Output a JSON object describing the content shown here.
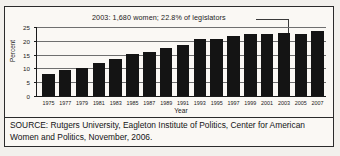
{
  "chart_data": {
    "type": "bar",
    "title": "",
    "xlabel": "Year",
    "ylabel": "Percent",
    "ylim": [
      0,
      25
    ],
    "yticks": [
      0,
      5,
      10,
      15,
      20,
      25
    ],
    "grid": true,
    "legend": null,
    "categories": [
      "1975",
      "1977",
      "1979",
      "1981",
      "1983",
      "1985",
      "1987",
      "1989",
      "1991",
      "1993",
      "1995",
      "1997",
      "1999",
      "2001",
      "2003",
      "2005",
      "2007"
    ],
    "values": [
      8.0,
      9.3,
      10.2,
      12.1,
      13.5,
      15.1,
      16.0,
      17.4,
      18.6,
      20.6,
      20.7,
      21.7,
      22.5,
      22.6,
      22.8,
      22.6,
      23.7
    ],
    "annotations": [
      {
        "text": "2003: 1,680 women; 22.8% of legislators",
        "points_to_category": "2003"
      }
    ],
    "bar_color": "#141414"
  },
  "source": {
    "text": "SOURCE: Rutgers University, Eagleton Institute of Politics, Center for American Women and Politics, November, 2006."
  },
  "colors": {
    "bar": "#141414",
    "grid": "#6f6f6f",
    "axis": "#1a1a1a",
    "background": "#faf8f4",
    "border": "#2b2b2b"
  }
}
